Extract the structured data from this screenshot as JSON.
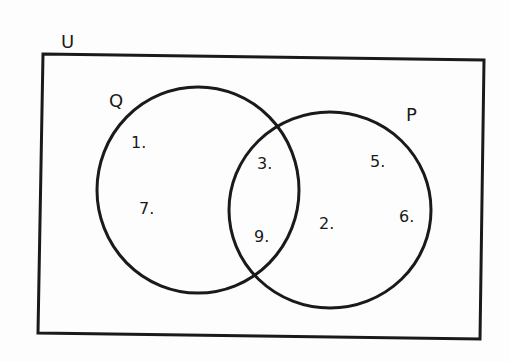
{
  "universe": {
    "label": "U"
  },
  "sets": [
    {
      "label": "Q",
      "elements_only": [
        "1.",
        "7."
      ]
    },
    {
      "label": "P",
      "elements_only": [
        "5.",
        "6.",
        "2."
      ]
    }
  ],
  "intersection": [
    "3.",
    "9."
  ],
  "labels": {
    "u": "U",
    "q": "Q",
    "p": "P",
    "e1": "1.",
    "e7": "7.",
    "e3": "3.",
    "e9": "9.",
    "e5": "5.",
    "e6": "6.",
    "e2": "2."
  },
  "colors": {
    "stroke": "#1a1a1a",
    "background": "#fdfdfd"
  }
}
